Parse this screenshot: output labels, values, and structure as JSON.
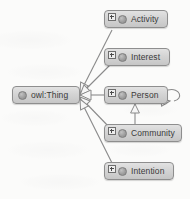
{
  "diagram": {
    "type": "ontology-class-hierarchy",
    "notation": "uml-generalization",
    "root": {
      "id": "owl-thing",
      "label": "owl:Thing",
      "has_expander": false,
      "icon": "class-circle-icon",
      "x": 12,
      "y": 86,
      "width": 68,
      "height": 18
    },
    "nodes": [
      {
        "id": "activity",
        "label": "Activity",
        "has_expander": true,
        "expander_icon": "plus-box-icon",
        "icon": "class-circle-icon",
        "x": 104,
        "y": 10,
        "width": 64,
        "height": 18
      },
      {
        "id": "interest",
        "label": "Interest",
        "has_expander": true,
        "expander_icon": "plus-box-icon",
        "icon": "class-circle-icon",
        "x": 104,
        "y": 48,
        "width": 66,
        "height": 18
      },
      {
        "id": "person",
        "label": "Person",
        "has_expander": true,
        "expander_icon": "plus-box-icon",
        "icon": "class-circle-icon",
        "x": 104,
        "y": 86,
        "width": 64,
        "height": 18
      },
      {
        "id": "community",
        "label": "Community",
        "has_expander": true,
        "expander_icon": "plus-box-icon",
        "icon": "class-circle-icon",
        "x": 104,
        "y": 124,
        "width": 78,
        "height": 18
      },
      {
        "id": "intention",
        "label": "Intention",
        "has_expander": true,
        "expander_icon": "plus-box-icon",
        "icon": "class-circle-icon",
        "x": 104,
        "y": 162,
        "width": 70,
        "height": 18
      }
    ],
    "edges": [
      {
        "id": "edge-activity",
        "from": "activity",
        "to": "owl-thing",
        "arrow": "hollow-triangle",
        "arrow_at": "source-side"
      },
      {
        "id": "edge-interest",
        "from": "interest",
        "to": "owl-thing",
        "arrow": "hollow-triangle",
        "arrow_at": "source-side"
      },
      {
        "id": "edge-person",
        "from": "person",
        "to": "owl-thing",
        "arrow": "hollow-triangle",
        "arrow_at": "source-side"
      },
      {
        "id": "edge-community",
        "from": "community",
        "to": "owl-thing",
        "arrow": "hollow-triangle",
        "arrow_at": "source-side"
      },
      {
        "id": "edge-intention",
        "from": "intention",
        "to": "owl-thing",
        "arrow": "hollow-triangle",
        "arrow_at": "source-side"
      },
      {
        "id": "edge-community-person",
        "from": "community",
        "to": "person",
        "arrow": "hollow-triangle",
        "arrow_at": "target"
      },
      {
        "id": "edge-person-self",
        "from": "person",
        "to": "person",
        "arrow": "hollow-triangle",
        "shape": "self-loop"
      }
    ],
    "colors": {
      "node_fill_top": "#e2e2e2",
      "node_fill_bottom": "#c6c6c6",
      "node_border": "#8e8e8e",
      "edge_line": "#8a8a8a",
      "arrow_fill": "#f4f4f4",
      "text": "#3a3a3a",
      "background": "#fbfbfa"
    }
  }
}
